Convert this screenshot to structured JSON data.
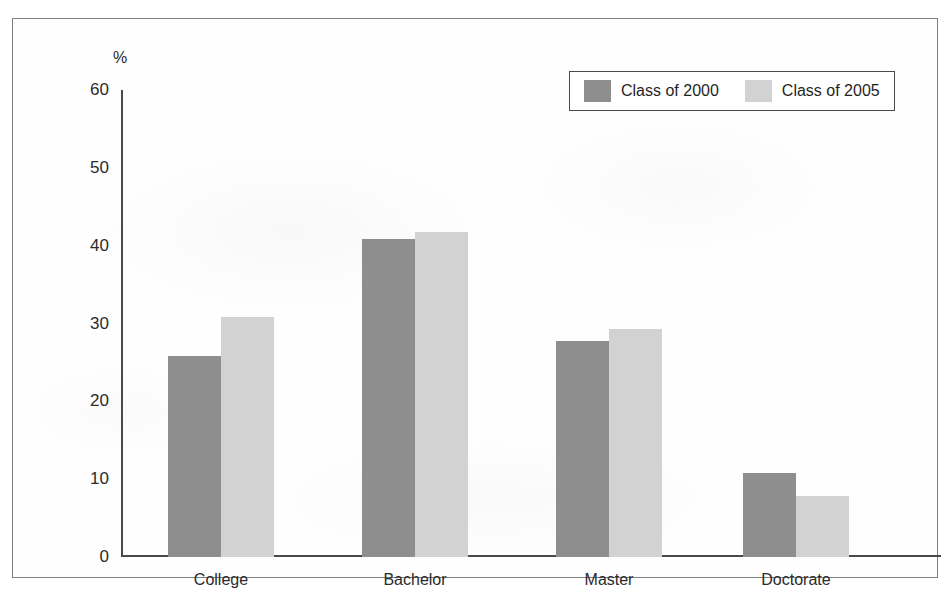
{
  "figure": {
    "title_fragment": "",
    "unit_label": "%"
  },
  "legend": {
    "items": [
      {
        "label": "Class of 2000",
        "color": "#8e8e8e"
      },
      {
        "label": "Class of 2005",
        "color": "#d2d2d2"
      }
    ]
  },
  "chart_data": {
    "type": "bar",
    "title": "",
    "xlabel": "",
    "ylabel": "%",
    "ylim": [
      0,
      60
    ],
    "yticks": [
      0,
      10,
      20,
      30,
      40,
      50,
      60
    ],
    "grid": false,
    "legend_position": "top-right",
    "categories": [
      "College",
      "Bachelor",
      "Master",
      "Doctorate"
    ],
    "series": [
      {
        "name": "Class of 2000",
        "color": "#8e8e8e",
        "values": [
          25.8,
          40.8,
          27.8,
          10.8
        ]
      },
      {
        "name": "Class of 2005",
        "color": "#d2d2d2",
        "values": [
          30.8,
          41.8,
          29.3,
          7.9
        ]
      }
    ]
  }
}
